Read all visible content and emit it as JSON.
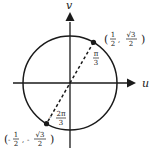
{
  "diagram": {
    "axes": {
      "horizontal_label": "u",
      "vertical_label": "v"
    },
    "circle": {
      "kind": "unit circle"
    },
    "points": [
      {
        "name": "point-pi-over-3",
        "angle_rad": 1.0471975512,
        "coord_label": {
          "open": "(",
          "x_sign": "",
          "x_num": "1",
          "x_den": "2",
          "sep": ",",
          "y_sign": "",
          "y_num": "√3",
          "y_den": "2",
          "close": ")"
        },
        "angle_label": {
          "sign": "",
          "num": "π",
          "den": "3"
        }
      },
      {
        "name": "point-minus-2pi-over-3",
        "angle_rad": -2.0943951024,
        "coord_label": {
          "open": "(",
          "x_sign": "-",
          "x_num": "1",
          "x_den": "2",
          "sep": ",",
          "y_sign": "-",
          "y_num": "√3",
          "y_den": "2",
          "close": ")"
        },
        "angle_label": {
          "sign": "-",
          "num": "2π",
          "den": "3"
        }
      }
    ],
    "colors": {
      "ink": "#1a1a1a",
      "background": "#ffffff"
    }
  }
}
